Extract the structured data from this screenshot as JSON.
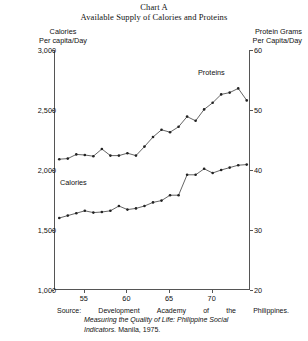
{
  "title": {
    "main": "Chart A",
    "sub": "Available Supply of Calories and Proteins"
  },
  "axis_headers": {
    "left_line1": "Calories",
    "left_line2": "Per capita/Day",
    "right_line1": "Protein Grams",
    "right_line2": "Per Capita/Day"
  },
  "source": {
    "label": "Source:",
    "w1": "Development",
    "w2": "Academy",
    "w3": "of",
    "w4": "the",
    "w5": "Philippines.",
    "line2": "Measuring the Quality of Life: Philippine Social",
    "line3_italic": "Indicators.",
    "line3_rest": " Manila, 1975."
  },
  "series_labels": {
    "calories": "Calories",
    "proteins": "Proteins"
  },
  "chart_data": {
    "type": "line",
    "title": "Available Supply of Calories and Proteins",
    "subtitle": "Chart A",
    "xlabel": "",
    "ylabel": "Calories Per capita/Day",
    "y2label": "Protein Grams Per Capita/Day",
    "xlim": [
      1951.5,
      1974.5
    ],
    "ylim": [
      1000,
      3000
    ],
    "y2lim": [
      20,
      60
    ],
    "yticks": [
      1000,
      1500,
      2000,
      2500,
      3000
    ],
    "ytick_labels": [
      "1,000",
      "1,500",
      "2,000",
      "2,500",
      "3,000"
    ],
    "y2ticks": [
      20,
      30,
      40,
      50,
      60
    ],
    "y2tick_labels": [
      "20",
      "30",
      "40",
      "50",
      "60"
    ],
    "xticks": [
      55,
      60,
      65,
      70
    ],
    "xtick_labels": [
      "55",
      "60",
      "65",
      "70"
    ],
    "grid": false,
    "legend": "inline-annotations",
    "x": [
      1952,
      1953,
      1954,
      1955,
      1956,
      1957,
      1958,
      1959,
      1960,
      1961,
      1962,
      1963,
      1964,
      1965,
      1966,
      1967,
      1968,
      1969,
      1970,
      1971,
      1972,
      1973,
      1974
    ],
    "series": [
      {
        "name": "Calories",
        "axis": "left",
        "values": [
          1600,
          1620,
          1640,
          1660,
          1645,
          1650,
          1660,
          1700,
          1670,
          1680,
          1700,
          1730,
          1745,
          1790,
          1790,
          1960,
          1960,
          2010,
          1975,
          2000,
          2020,
          2040,
          2045
        ]
      },
      {
        "name": "Proteins",
        "axis": "right",
        "values": [
          41.8,
          41.9,
          42.6,
          42.5,
          42.3,
          43.5,
          42.4,
          42.4,
          42.8,
          42.4,
          43.9,
          45.5,
          46.7,
          46.3,
          47.2,
          48.9,
          48.2,
          50.1,
          51.2,
          52.6,
          52.9,
          53.6,
          51.6
        ]
      }
    ]
  }
}
